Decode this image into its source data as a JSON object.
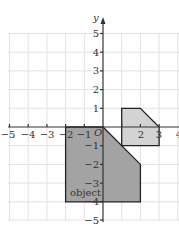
{
  "diagram": {
    "axes": {
      "x_label": "x",
      "y_label": "y",
      "origin_label": "O",
      "x_ticks": [
        "−5",
        "−4",
        "−3",
        "−2",
        "−1",
        "1",
        "2",
        "3",
        "4"
      ],
      "y_ticks": [
        "5",
        "4",
        "3",
        "2",
        "1",
        "−1",
        "−2",
        "−3",
        "−4",
        "−5"
      ]
    },
    "shapes": {
      "object": {
        "label": "object",
        "vertices": [
          [
            -2,
            0
          ],
          [
            0,
            0
          ],
          [
            2,
            -2
          ],
          [
            2,
            -4
          ],
          [
            -2,
            -4
          ]
        ],
        "fill": "#a3a3a3"
      },
      "image": {
        "vertices": [
          [
            1,
            -1
          ],
          [
            1,
            1
          ],
          [
            2,
            1
          ],
          [
            3,
            0
          ],
          [
            3,
            -1
          ]
        ],
        "fill": "#d3d3d3"
      }
    },
    "colors": {
      "grid": "#e2e2e2",
      "axis": "#333333",
      "outline": "#222222"
    }
  }
}
